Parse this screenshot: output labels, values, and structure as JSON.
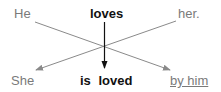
{
  "diagram": {
    "top_row": {
      "subject": "He",
      "verb": "loves",
      "object": "her."
    },
    "bottom_row": {
      "subject": "She",
      "verb": "is loved",
      "agent": "by him"
    },
    "colors": {
      "gray_text": "#7a7a7a",
      "dark_text": "#111111",
      "gray_arrow": "#8a8a8a",
      "dark_arrow": "#111111"
    },
    "arrows": [
      {
        "from": "He",
        "to": "by him"
      },
      {
        "from": "her.",
        "to": "She"
      },
      {
        "from": "loves",
        "to": "is loved"
      }
    ]
  }
}
